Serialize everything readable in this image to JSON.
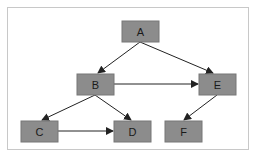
{
  "diagram": {
    "type": "directed-graph",
    "node_fill": "#8c8c8c",
    "node_stroke": "#6e6e6e",
    "edge_color": "#222222",
    "border_color": "#c8c8c8",
    "nodes": [
      {
        "id": "A",
        "label": "A",
        "x": 122,
        "y": 21,
        "w": 37,
        "h": 21
      },
      {
        "id": "B",
        "label": "B",
        "x": 77,
        "y": 74,
        "w": 37,
        "h": 21
      },
      {
        "id": "E",
        "label": "E",
        "x": 199,
        "y": 74,
        "w": 37,
        "h": 21
      },
      {
        "id": "C",
        "label": "C",
        "x": 21,
        "y": 121,
        "w": 37,
        "h": 21
      },
      {
        "id": "D",
        "label": "D",
        "x": 114,
        "y": 121,
        "w": 37,
        "h": 21
      },
      {
        "id": "F",
        "label": "F",
        "x": 165,
        "y": 121,
        "w": 37,
        "h": 21
      }
    ],
    "edges": [
      {
        "from": "A",
        "to": "B"
      },
      {
        "from": "A",
        "to": "E"
      },
      {
        "from": "B",
        "to": "E"
      },
      {
        "from": "B",
        "to": "C"
      },
      {
        "from": "B",
        "to": "D"
      },
      {
        "from": "C",
        "to": "D"
      },
      {
        "from": "E",
        "to": "F"
      }
    ]
  }
}
